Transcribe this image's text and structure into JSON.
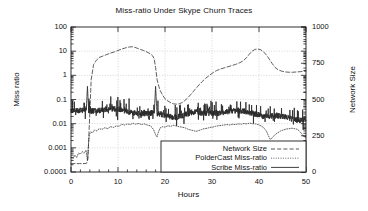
{
  "chart_data": {
    "type": "line",
    "title": "Miss-ratio Under Skype Churn Traces",
    "xlabel": "Hours",
    "ylabel": "Miss ratio",
    "ylabel_right": "Network Size",
    "grid": true,
    "legend_position": "bottom-right",
    "xlim": [
      0,
      50
    ],
    "xticks": [
      "0",
      "10",
      "20",
      "30",
      "40",
      "50"
    ],
    "xtick_values": [
      0,
      10,
      20,
      30,
      40,
      50
    ],
    "ylim_left": [
      0.0001,
      100
    ],
    "yscale_left": "log",
    "yticks_left": [
      "0.0001",
      "0.001",
      "0.01",
      "0.1",
      "1",
      "10",
      "100"
    ],
    "ytick_values_left": [
      0.0001,
      0.001,
      0.01,
      0.1,
      1,
      10,
      100
    ],
    "ylim_right": [
      0,
      1000
    ],
    "yscale_right": "linear",
    "yticks_right": [
      "0",
      "250",
      "500",
      "750",
      "1000"
    ],
    "ytick_values_right": [
      0,
      250,
      500,
      750,
      1000
    ],
    "series": [
      {
        "name": "Network Size",
        "axis": "right",
        "style": "dashed",
        "x": [
          0.0,
          0.6,
          1.2,
          1.8,
          2.4,
          3.0,
          3.3,
          3.6,
          3.9,
          4.3,
          4.8,
          5.4,
          6.0,
          6.8,
          7.6,
          8.4,
          9.2,
          10.0,
          10.8,
          11.6,
          12.4,
          13.0,
          13.6,
          14.2,
          14.8,
          15.4,
          16.0,
          16.6,
          17.0,
          17.4,
          17.7,
          18.0,
          18.3,
          18.6,
          19.0,
          19.5,
          20.0,
          20.6,
          21.2,
          21.8,
          22.4,
          23.0,
          23.6,
          24.2,
          24.8,
          25.5,
          26.2,
          27.0,
          27.8,
          28.6,
          29.4,
          30.2,
          31.0,
          31.8,
          32.6,
          33.4,
          34.2,
          35.0,
          35.8,
          36.6,
          37.4,
          38.0,
          38.6,
          39.2,
          39.8,
          40.4,
          41.0,
          41.6,
          42.2,
          42.8,
          43.4,
          44.0,
          44.8,
          45.6,
          46.4,
          47.2,
          48.0,
          48.8,
          49.4,
          50.0
        ],
        "y": [
          58,
          58,
          58,
          58,
          58,
          58,
          60,
          90,
          330,
          640,
          740,
          770,
          790,
          800,
          810,
          820,
          828,
          838,
          848,
          856,
          862,
          864,
          860,
          852,
          845,
          838,
          830,
          820,
          812,
          800,
          780,
          720,
          640,
          600,
          560,
          530,
          505,
          490,
          478,
          470,
          468,
          470,
          478,
          492,
          510,
          535,
          562,
          592,
          620,
          645,
          665,
          685,
          700,
          710,
          718,
          726,
          734,
          742,
          752,
          766,
          790,
          815,
          835,
          846,
          848,
          842,
          828,
          806,
          778,
          748,
          722,
          706,
          696,
          690,
          688,
          688,
          690,
          692,
          694,
          696
        ]
      },
      {
        "name": "PolderCast Miss-ratio",
        "axis": "left",
        "style": "dotted",
        "x": [
          0.0,
          0.4,
          0.8,
          1.2,
          1.6,
          2.0,
          2.4,
          2.8,
          3.2,
          3.5,
          3.7,
          3.9,
          4.2,
          4.6,
          5.0,
          5.5,
          6.0,
          6.6,
          7.2,
          7.8,
          8.4,
          9.0,
          9.6,
          10.2,
          10.8,
          11.4,
          12.0,
          12.6,
          13.2,
          13.8,
          14.4,
          15.0,
          15.6,
          16.2,
          16.8,
          17.2,
          17.6,
          18.0,
          18.3,
          18.6,
          19.0,
          19.5,
          20.0,
          20.6,
          21.2,
          21.8,
          22.4,
          23.0,
          23.6,
          24.2,
          24.8,
          25.4,
          26.0,
          26.6,
          27.2,
          27.8,
          28.4,
          29.0,
          29.6,
          30.2,
          30.8,
          31.4,
          32.0,
          32.6,
          33.2,
          33.8,
          34.4,
          35.0,
          35.6,
          36.2,
          36.8,
          37.4,
          38.0,
          38.6,
          39.2,
          39.8,
          40.4,
          41.0,
          41.6,
          42.0,
          42.4,
          42.8,
          43.4,
          44.0,
          44.6,
          45.2,
          45.8,
          46.4,
          47.0,
          47.6,
          48.2,
          48.8,
          49.4,
          50.0
        ],
        "y": [
          0.0004,
          0.00035,
          0.0005,
          0.0004,
          0.0006,
          0.00055,
          0.0007,
          0.0006,
          0.0008,
          0.0003,
          0.0012,
          0.0035,
          0.0045,
          0.0042,
          0.0055,
          0.005,
          0.0062,
          0.0058,
          0.0068,
          0.0062,
          0.0075,
          0.007,
          0.008,
          0.0078,
          0.0095,
          0.0088,
          0.0098,
          0.0092,
          0.0105,
          0.0095,
          0.0102,
          0.0092,
          0.0098,
          0.0088,
          0.0082,
          0.0072,
          0.0055,
          0.0035,
          0.0028,
          0.0045,
          0.0068,
          0.0075,
          0.0072,
          0.0082,
          0.0078,
          0.0085,
          0.008,
          0.0075,
          0.0072,
          0.0068,
          0.006,
          0.0055,
          0.0052,
          0.0048,
          0.0052,
          0.0058,
          0.0062,
          0.0065,
          0.007,
          0.0072,
          0.0078,
          0.0082,
          0.0085,
          0.0088,
          0.0092,
          0.0088,
          0.0095,
          0.0092,
          0.0098,
          0.0095,
          0.0102,
          0.0098,
          0.0105,
          0.01,
          0.0098,
          0.0092,
          0.0082,
          0.0068,
          0.0048,
          0.0032,
          0.0022,
          0.0026,
          0.0035,
          0.0042,
          0.005,
          0.0055,
          0.006,
          0.0062,
          0.0065,
          0.0062,
          0.0058,
          0.0045,
          0.0032,
          0.0026
        ]
      },
      {
        "name": "Scribe Miss-ratio",
        "axis": "left",
        "style": "solid",
        "baseline": 0.03,
        "spike_hours": [
          3.5,
          18.0
        ],
        "spike_peak": 0.35,
        "noise_low": 0.012,
        "noise_high": 0.09
      }
    ],
    "legend": [
      {
        "label": "Network Size",
        "style": "dashed"
      },
      {
        "label": "PolderCast Miss-ratio",
        "style": "dotted"
      },
      {
        "label": "Scribe Miss-ratio",
        "style": "solid"
      }
    ]
  },
  "colors": {
    "axis": "#1a1a1a",
    "grid": "#bdbdbd",
    "series": "#2b2b2b",
    "background": "#ffffff"
  }
}
